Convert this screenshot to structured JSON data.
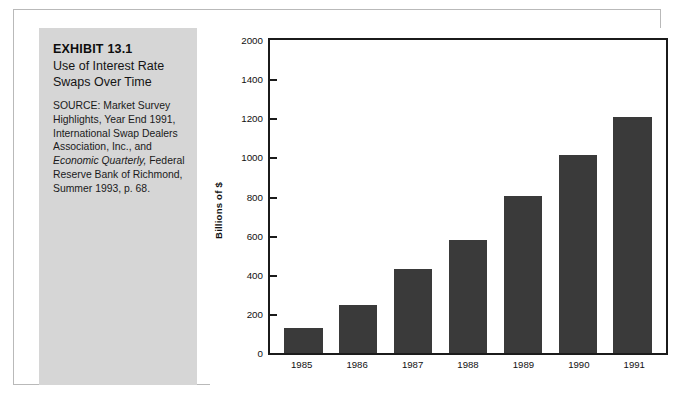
{
  "exhibit": {
    "number": "EXHIBIT 13.1",
    "title": "Use of Interest Rate Swaps Over Time",
    "source_part1": "SOURCE: Market Survey Highlights, Year End 1991, International Swap Dealers Association, Inc., and ",
    "source_italic": "Economic Quarterly,",
    "source_part2": " Federal Reserve Bank of Richmond, Summer 1993, p. 68."
  },
  "chart_data": {
    "type": "bar",
    "title": "Use of Interest Rate Swaps Over Time",
    "categories": [
      "1985",
      "1986",
      "1987",
      "1988",
      "1989",
      "1990",
      "1991"
    ],
    "values": [
      160,
      310,
      540,
      720,
      1005,
      1265,
      1505
    ],
    "xlabel": "",
    "ylabel": "Billions of $",
    "ylim": [
      0,
      2000
    ],
    "ytick_labels": [
      "2000",
      "1400",
      "1200",
      "1000",
      "800",
      "600",
      "400",
      "200",
      "0"
    ],
    "ytick_values": [
      2000,
      1750,
      1500,
      1250,
      1000,
      750,
      500,
      250,
      0
    ],
    "grid": false,
    "legend": false,
    "bar_color": "#3a3a3a",
    "axis_color": "#1b1b1b",
    "panel_color": "#d6d6d6"
  }
}
